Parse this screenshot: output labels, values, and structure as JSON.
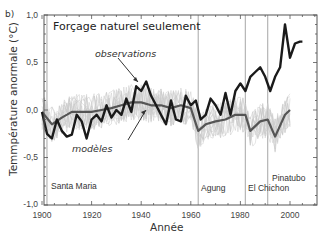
{
  "panel_label": "b)",
  "chart_data": {
    "type": "line",
    "title": "Forçage naturel seulement",
    "xlabel": "Année",
    "ylabel": "Temmpérature anormale (°C)",
    "xlim": [
      1900,
      2010
    ],
    "ylim": [
      -1.0,
      1.0
    ],
    "x_ticks": [
      "1900",
      "1920",
      "1940",
      "1960",
      "1980",
      "2000"
    ],
    "y_ticks": [
      "1,0",
      "0,5",
      "0,0",
      "-0,5",
      "-1,0"
    ],
    "grid": false,
    "annotations": [
      {
        "text": "observations",
        "style": "italic",
        "points_to": "observations"
      },
      {
        "text": "modèles",
        "style": "italic",
        "points_to": "modèles"
      }
    ],
    "volcanoes": [
      {
        "name": "Santa Maria",
        "year": 1902
      },
      {
        "name": "Agung",
        "year": 1963
      },
      {
        "name": "El Chichon",
        "year": 1982
      },
      {
        "name": "Pinatubo",
        "year": 1991
      }
    ],
    "series": [
      {
        "name": "observations",
        "color": "#1a1a1a",
        "x": [
          1900,
          1902,
          1904,
          1906,
          1908,
          1910,
          1912,
          1914,
          1916,
          1918,
          1920,
          1922,
          1924,
          1926,
          1928,
          1930,
          1932,
          1934,
          1936,
          1938,
          1940,
          1942,
          1944,
          1946,
          1948,
          1950,
          1952,
          1954,
          1956,
          1958,
          1960,
          1962,
          1964,
          1966,
          1968,
          1970,
          1972,
          1974,
          1976,
          1978,
          1980,
          1982,
          1984,
          1986,
          1988,
          1990,
          1992,
          1994,
          1996,
          1998,
          2000,
          2002,
          2004,
          2005
        ],
        "values": [
          -0.02,
          -0.25,
          -0.3,
          -0.1,
          -0.22,
          -0.28,
          -0.26,
          -0.05,
          -0.12,
          -0.3,
          -0.1,
          -0.05,
          -0.12,
          0.05,
          -0.08,
          0.0,
          -0.05,
          0.12,
          -0.02,
          0.25,
          0.2,
          0.3,
          0.15,
          0.05,
          -0.05,
          -0.15,
          0.1,
          -0.1,
          -0.12,
          0.15,
          0.05,
          0.1,
          -0.1,
          -0.05,
          0.12,
          0.05,
          -0.05,
          0.18,
          -0.05,
          0.2,
          0.28,
          0.2,
          0.35,
          0.4,
          0.45,
          0.35,
          0.2,
          0.35,
          0.45,
          0.9,
          0.55,
          0.7,
          0.72,
          0.72
        ]
      },
      {
        "name": "modèles",
        "color": "#555555",
        "x": [
          1900,
          1904,
          1908,
          1912,
          1916,
          1920,
          1924,
          1928,
          1932,
          1936,
          1940,
          1944,
          1948,
          1952,
          1956,
          1960,
          1963,
          1966,
          1970,
          1974,
          1978,
          1982,
          1984,
          1988,
          1991,
          1994,
          1998,
          2000
        ],
        "values": [
          -0.02,
          -0.15,
          -0.08,
          -0.02,
          -0.02,
          -0.02,
          0.0,
          0.02,
          0.05,
          0.08,
          0.08,
          0.05,
          0.05,
          0.02,
          0.05,
          0.02,
          -0.22,
          -0.15,
          -0.12,
          -0.1,
          -0.05,
          -0.05,
          -0.22,
          -0.12,
          -0.1,
          -0.28,
          -0.05,
          0.0
        ]
      }
    ]
  }
}
